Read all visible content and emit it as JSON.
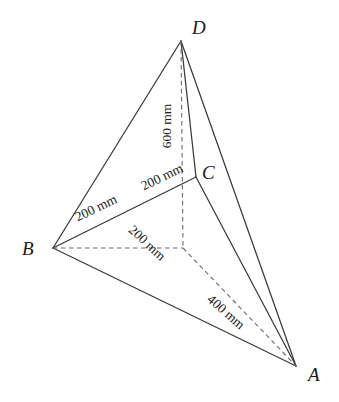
{
  "figure": {
    "type": "geometry-diagram",
    "shape": "tetrahedron",
    "background_color": "#ffffff",
    "line_color": "#3a3a3a",
    "text_color": "#1b1b1b",
    "width": 339,
    "height": 402,
    "vertices": [
      {
        "name": "A",
        "label": "A",
        "x": 296,
        "y": 366,
        "label_x": 308,
        "label_y": 365
      },
      {
        "name": "B",
        "label": "B",
        "x": 53,
        "y": 248,
        "label_x": 22,
        "label_y": 239
      },
      {
        "name": "C",
        "label": "C",
        "x": 196,
        "y": 177,
        "label_x": 202,
        "label_y": 163
      },
      {
        "name": "D",
        "label": "D",
        "x": 181,
        "y": 41,
        "label_x": 192,
        "label_y": 18
      },
      {
        "name": "O",
        "label": "",
        "x": 183,
        "y": 248,
        "label_x": 0,
        "label_y": 0
      }
    ],
    "solid_edges": [
      {
        "name": "edge-B-D",
        "from": "B",
        "to": "D"
      },
      {
        "name": "edge-B-C",
        "from": "B",
        "to": "C"
      },
      {
        "name": "edge-B-A",
        "from": "B",
        "to": "A"
      },
      {
        "name": "edge-D-C",
        "from": "D",
        "to": "C"
      },
      {
        "name": "edge-D-A",
        "from": "D",
        "to": "A"
      },
      {
        "name": "edge-C-A",
        "from": "C",
        "to": "A"
      }
    ],
    "dashed_edges": [
      {
        "name": "dashed-D-O",
        "from": "D",
        "to": "O"
      },
      {
        "name": "dashed-B-O",
        "from": "B",
        "to": "O"
      },
      {
        "name": "dashed-O-A",
        "from": "O",
        "to": "A"
      }
    ],
    "dimension_labels": [
      {
        "name": "dimension-600mm-vertical",
        "text": "600 mm",
        "value": 600,
        "unit": "mm",
        "measures": "D-O",
        "x": 167,
        "y": 126,
        "rotation": -90
      },
      {
        "name": "dimension-200mm-bc-lower",
        "text": "200 mm",
        "value": 200,
        "unit": "mm",
        "measures": "B-midpoint",
        "x": 96,
        "y": 208,
        "rotation": -26
      },
      {
        "name": "dimension-200mm-bc-upper",
        "text": "200 mm",
        "value": 200,
        "unit": "mm",
        "measures": "midpoint-C",
        "x": 162,
        "y": 177,
        "rotation": -26
      },
      {
        "name": "dimension-200mm-bo",
        "text": "200 mm",
        "value": 200,
        "unit": "mm",
        "measures": "B-O",
        "x": 147,
        "y": 243,
        "rotation": 43
      },
      {
        "name": "dimension-400mm-oa",
        "text": "400 mm",
        "value": 400,
        "unit": "mm",
        "measures": "O-A",
        "x": 226,
        "y": 312,
        "rotation": 41
      }
    ]
  }
}
